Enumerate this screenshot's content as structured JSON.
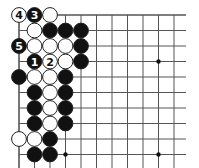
{
  "diagram": {
    "type": "go-board-fragment",
    "grid": {
      "origin_x": 19,
      "origin_y": 15,
      "spacing": 15.5,
      "cols": 11,
      "rows": 11,
      "line_extend_right": 186,
      "line_extend_bottom": 168
    },
    "colors": {
      "line": "#555555",
      "black_stone": "#111111",
      "white_stone": "#ffffff",
      "stone_outline": "#222222"
    },
    "star_points": [
      [
        9,
        3
      ],
      [
        3,
        9
      ],
      [
        9,
        9
      ]
    ],
    "stones": [
      {
        "col": 0,
        "row": 0,
        "color": "white",
        "label": "4"
      },
      {
        "col": 1,
        "row": 0,
        "color": "black",
        "label": "3"
      },
      {
        "col": 2,
        "row": 0,
        "color": "white",
        "label": ""
      },
      {
        "col": 1,
        "row": 1,
        "color": "white",
        "label": ""
      },
      {
        "col": 2,
        "row": 1,
        "color": "black",
        "label": ""
      },
      {
        "col": 3,
        "row": 1,
        "color": "black",
        "label": ""
      },
      {
        "col": 4,
        "row": 1,
        "color": "black",
        "label": ""
      },
      {
        "col": 0,
        "row": 2,
        "color": "black",
        "label": "5"
      },
      {
        "col": 1,
        "row": 2,
        "color": "white",
        "label": ""
      },
      {
        "col": 2,
        "row": 2,
        "color": "white",
        "label": ""
      },
      {
        "col": 3,
        "row": 2,
        "color": "white",
        "label": ""
      },
      {
        "col": 4,
        "row": 2,
        "color": "black",
        "label": ""
      },
      {
        "col": 1,
        "row": 3,
        "color": "black",
        "label": "1"
      },
      {
        "col": 2,
        "row": 3,
        "color": "white",
        "label": "2"
      },
      {
        "col": 3,
        "row": 3,
        "color": "white",
        "label": ""
      },
      {
        "col": 4,
        "row": 3,
        "color": "black",
        "label": ""
      },
      {
        "col": 0,
        "row": 4,
        "color": "black",
        "label": ""
      },
      {
        "col": 1,
        "row": 4,
        "color": "white",
        "label": ""
      },
      {
        "col": 2,
        "row": 4,
        "color": "white",
        "label": ""
      },
      {
        "col": 3,
        "row": 4,
        "color": "black",
        "label": ""
      },
      {
        "col": 1,
        "row": 5,
        "color": "black",
        "label": ""
      },
      {
        "col": 2,
        "row": 5,
        "color": "white",
        "label": ""
      },
      {
        "col": 3,
        "row": 5,
        "color": "black",
        "label": ""
      },
      {
        "col": 1,
        "row": 6,
        "color": "black",
        "label": ""
      },
      {
        "col": 2,
        "row": 6,
        "color": "white",
        "label": ""
      },
      {
        "col": 3,
        "row": 6,
        "color": "black",
        "label": ""
      },
      {
        "col": 1,
        "row": 7,
        "color": "black",
        "label": ""
      },
      {
        "col": 2,
        "row": 7,
        "color": "white",
        "label": ""
      },
      {
        "col": 3,
        "row": 7,
        "color": "black",
        "label": ""
      },
      {
        "col": 0,
        "row": 8,
        "color": "white",
        "label": ""
      },
      {
        "col": 1,
        "row": 8,
        "color": "white",
        "label": ""
      },
      {
        "col": 2,
        "row": 8,
        "color": "black",
        "label": ""
      },
      {
        "col": 1,
        "row": 9,
        "color": "black",
        "label": ""
      },
      {
        "col": 2,
        "row": 9,
        "color": "black",
        "label": ""
      }
    ]
  }
}
